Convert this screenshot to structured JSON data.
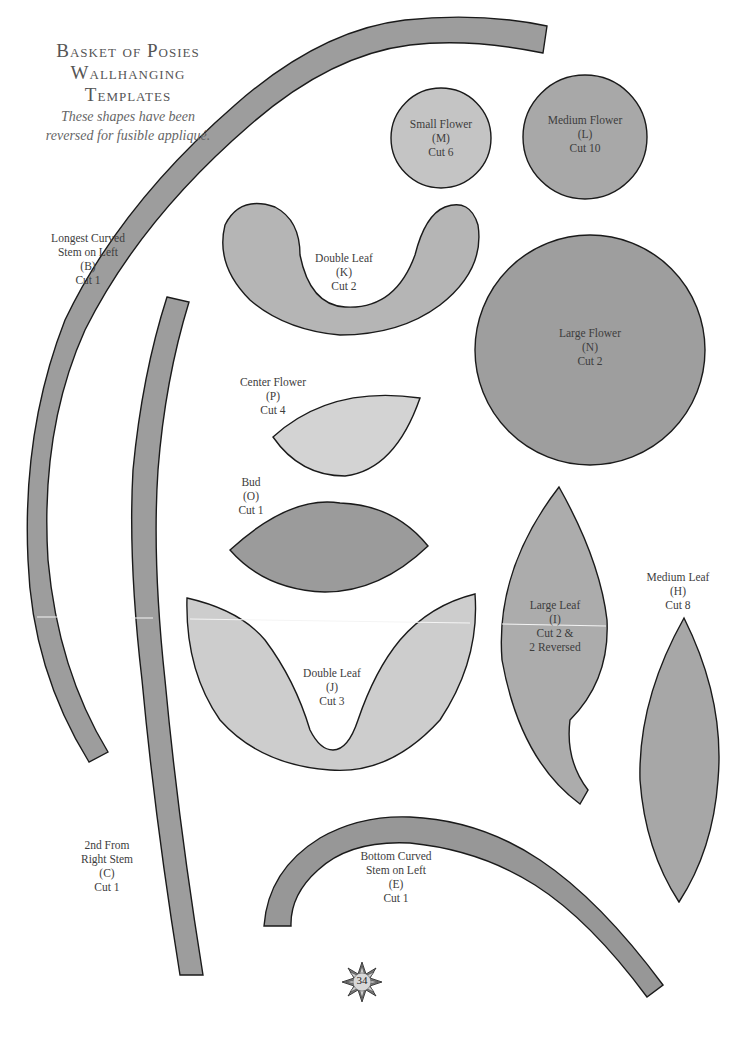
{
  "title": {
    "lines": [
      "Basket of Posies",
      "Wallhanging",
      "Templates"
    ],
    "subtitle_lines": [
      "These shapes have been",
      "reversed for fusible appliqué."
    ]
  },
  "colors": {
    "dark_fill": "#9a9a9a",
    "medium_fill": "#ababab",
    "light_fill": "#c9c9c9",
    "lightest_fill": "#d6d6d6",
    "outline": "#1a1a1a",
    "background": "#ffffff"
  },
  "templates": [
    {
      "id": "B",
      "name": "Longest Curved",
      "lines": [
        "Longest Curved",
        "Stem on Left",
        "(B)",
        "Cut 1"
      ]
    },
    {
      "id": "C",
      "name": "2nd From Right Stem",
      "lines": [
        "2nd From",
        "Right Stem",
        "(C)",
        "Cut 1"
      ]
    },
    {
      "id": "M",
      "name": "Small Flower",
      "lines": [
        "Small Flower",
        "(M)",
        "Cut 6"
      ]
    },
    {
      "id": "L",
      "name": "Medium Flower",
      "lines": [
        "Medium Flower",
        "(L)",
        "Cut 10"
      ]
    },
    {
      "id": "K",
      "name": "Double Leaf",
      "lines": [
        "Double Leaf",
        "(K)",
        "Cut 2"
      ]
    },
    {
      "id": "N",
      "name": "Large Flower",
      "lines": [
        "Large Flower",
        "(N)",
        "Cut 2"
      ]
    },
    {
      "id": "P",
      "name": "Center Flower",
      "lines": [
        "Center Flower",
        "(P)",
        "Cut 4"
      ]
    },
    {
      "id": "O",
      "name": "Bud",
      "lines": [
        "Bud",
        "(O)",
        "Cut 1"
      ]
    },
    {
      "id": "J",
      "name": "Double Leaf",
      "lines": [
        "Double Leaf",
        "(J)",
        "Cut 3"
      ]
    },
    {
      "id": "I",
      "name": "Large Leaf",
      "lines": [
        "Large Leaf",
        "(I)",
        "Cut 2 &",
        "2 Reversed"
      ]
    },
    {
      "id": "H",
      "name": "Medium Leaf",
      "lines": [
        "Medium Leaf",
        "(H)",
        "Cut 8"
      ]
    },
    {
      "id": "E",
      "name": "Bottom Curved Stem on Left",
      "lines": [
        "Bottom Curved",
        "Stem on Left",
        "(E)",
        "Cut 1"
      ]
    }
  ],
  "page_number": "34"
}
